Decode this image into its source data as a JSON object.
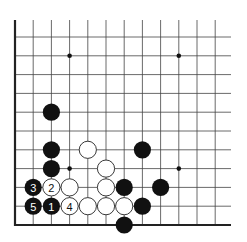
{
  "board": {
    "origin_x": 15,
    "origin_y": 225,
    "spacing_x": 18.2,
    "spacing_y": 18.8,
    "cols_visible": 12,
    "right_edge_x": 231,
    "top_edge_y": 20,
    "line_color": "#444444",
    "edge_color": "#222222",
    "black_color": "#111111",
    "white_fill": "#ffffff",
    "white_stroke": "#222222"
  },
  "star_points": [
    {
      "col": 3,
      "row": 1
    },
    {
      "col": 9,
      "row": 1
    },
    {
      "col": 3,
      "row": 7
    },
    {
      "col": 9,
      "row": 7
    }
  ],
  "stones": [
    {
      "color": "black",
      "col": 2,
      "row": 4,
      "label": ""
    },
    {
      "color": "black",
      "col": 2,
      "row": 6,
      "label": ""
    },
    {
      "color": "white",
      "col": 4,
      "row": 6,
      "label": ""
    },
    {
      "color": "black",
      "col": 7,
      "row": 6,
      "label": ""
    },
    {
      "color": "black",
      "col": 2,
      "row": 7,
      "label": ""
    },
    {
      "color": "white",
      "col": 5,
      "row": 7,
      "label": ""
    },
    {
      "color": "black",
      "col": 1,
      "row": 8,
      "label": "3"
    },
    {
      "color": "white",
      "col": 2,
      "row": 8,
      "label": "2"
    },
    {
      "color": "white",
      "col": 3,
      "row": 8,
      "label": ""
    },
    {
      "color": "white",
      "col": 5,
      "row": 8,
      "label": ""
    },
    {
      "color": "black",
      "col": 6,
      "row": 8,
      "label": ""
    },
    {
      "color": "black",
      "col": 8,
      "row": 8,
      "label": ""
    },
    {
      "color": "black",
      "col": 1,
      "row": 9,
      "label": "5"
    },
    {
      "color": "black",
      "col": 2,
      "row": 9,
      "label": "1"
    },
    {
      "color": "white",
      "col": 3,
      "row": 9,
      "label": "4"
    },
    {
      "color": "white",
      "col": 4,
      "row": 9,
      "label": ""
    },
    {
      "color": "white",
      "col": 5,
      "row": 9,
      "label": ""
    },
    {
      "color": "white",
      "col": 6,
      "row": 9,
      "label": ""
    },
    {
      "color": "black",
      "col": 7,
      "row": 9,
      "label": ""
    },
    {
      "color": "black",
      "col": 6,
      "row": 10,
      "label": ""
    }
  ]
}
